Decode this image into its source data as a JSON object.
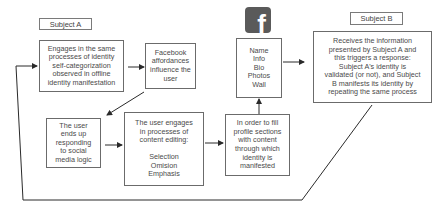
{
  "diagram": {
    "subject_a_label": "Subject A",
    "subject_b_label": "Subject B",
    "nodes": {
      "engages": "Engages in the same\nprocesses of identity\nself-categorization\nobserved in offline\nidentity manifestation",
      "affordances": "Facebook\naffordances\ninfluence the\nuser",
      "profile_sections": "Name\nInfo\nBio\nPhotos\nWall",
      "subject_b_response": "Receives the information\npresented by Subject A and\nthis triggers a response:\nSubject A's identity is\nvalidated (or not), and Subject\nB manifests its identity by\nrepeating the same process",
      "social_logic": "The user\nends up\nresponding\nto social\nmedia logic",
      "content_editing": "The user engages\nin processes of\ncontent editing:\n\nSelection\nOmision\nEmphasis",
      "fill_profile": "In order to fill\nprofile sections\nwith content\nthrough which\nidentity is\nmanifested"
    },
    "icon": {
      "name": "facebook-logo-icon",
      "glyph": "f",
      "color": "#5a5a5a"
    },
    "line_color": "#2a2a2a"
  }
}
